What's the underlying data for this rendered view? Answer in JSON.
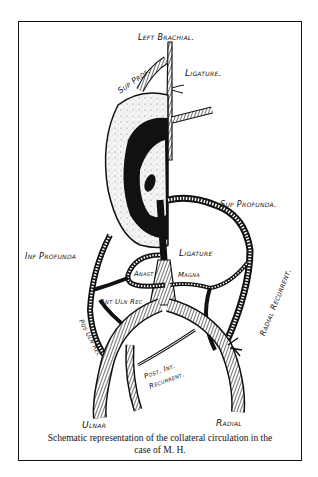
{
  "figure": {
    "caption_line1": "Schematic representation of the collateral circulation in the",
    "caption_line2": "case of M. H.",
    "labels": {
      "left_brachial": "Left Brachial.",
      "sup_prof": "Sup Prof.",
      "ligature_top": "Ligature.",
      "sup_profunda": "Sup Profunda.",
      "inf_profunda": "Inf Profunda",
      "ligature_mid": "Ligature",
      "anast": "Anast",
      "magna": "Magna",
      "ant_uln_rec": "Ant Uln Rec",
      "pos_uln_rec": "Pos Uln Rec",
      "radial_recurrent": "Radial Recurrent.",
      "post_int_recurrent_1": "Post. Int.",
      "post_int_recurrent_2": "Recurrent.",
      "ulnar": "Ulnar",
      "radial": "Radial"
    }
  }
}
